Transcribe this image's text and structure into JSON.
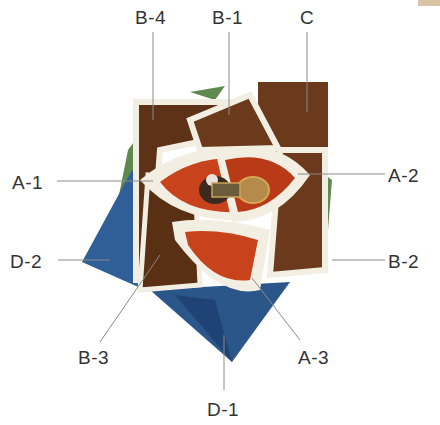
{
  "diagram": {
    "colors": {
      "brown": "#6b3a1c",
      "brown_dark": "#4a2510",
      "orange": "#c8431c",
      "cream": "#f3eee2",
      "blue": "#2f5f96",
      "blue_dark": "#1f4374",
      "green": "#5f8a4f",
      "leader_line": "#8a8a8a",
      "label_text": "#333333"
    },
    "labels": [
      {
        "id": "B-4",
        "text": "B-4",
        "x": 135,
        "y": 8
      },
      {
        "id": "B-1",
        "text": "B-1",
        "x": 212,
        "y": 8
      },
      {
        "id": "C",
        "text": "C",
        "x": 300,
        "y": 8
      },
      {
        "id": "A-1",
        "text": "A-1",
        "x": 12,
        "y": 173
      },
      {
        "id": "A-2",
        "text": "A-2",
        "x": 388,
        "y": 166
      },
      {
        "id": "D-2",
        "text": "D-2",
        "x": 10,
        "y": 252
      },
      {
        "id": "B-2",
        "text": "B-2",
        "x": 388,
        "y": 252
      },
      {
        "id": "B-3",
        "text": "B-3",
        "x": 78,
        "y": 348
      },
      {
        "id": "A-3",
        "text": "A-3",
        "x": 298,
        "y": 348
      },
      {
        "id": "D-1",
        "text": "D-1",
        "x": 207,
        "y": 400
      }
    ]
  }
}
